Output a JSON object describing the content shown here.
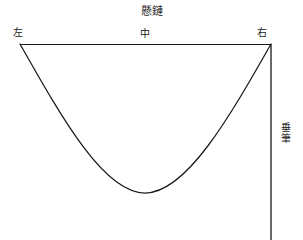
{
  "diagram": {
    "type": "hand-drawn-curve-diagram",
    "title": "懸鏈",
    "labels": {
      "left": "左",
      "middle": "中",
      "right": "右",
      "vertical_right": "垂筆"
    },
    "colors": {
      "stroke": "#1a1a1a",
      "background": "#ffffff",
      "text": "#222222"
    },
    "geometry": {
      "horizontal_line": {
        "x1": 20,
        "y1": 44,
        "x2": 271,
        "y2": 44
      },
      "vertical_line": {
        "x1": 271,
        "y1": 44,
        "x2": 271,
        "y2": 240
      },
      "curve": {
        "start_x": 20,
        "start_y": 44,
        "vertex_x": 145,
        "vertex_y": 193,
        "end_x": 271,
        "end_y": 44
      },
      "stroke_width": 1.2
    }
  }
}
